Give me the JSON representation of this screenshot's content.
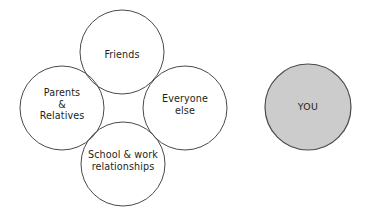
{
  "diagram": {
    "type": "venn-quatrefoil",
    "background_color": "#ffffff",
    "outline_color": "#4a4a4a",
    "text_color": "#231f20",
    "fill_color": "#cccccc",
    "groups": {
      "friends": {
        "label": "Friends",
        "shape": "circle",
        "position": "top",
        "cx": 122,
        "cy": 52,
        "r": 42,
        "filled": false
      },
      "parents": {
        "label": "Parents\n&\nRelatives",
        "shape": "circle",
        "position": "left",
        "cx": 62,
        "cy": 108,
        "r": 42,
        "filled": false
      },
      "everyone": {
        "label": "Everyone\nelse",
        "shape": "circle",
        "position": "right",
        "cx": 185,
        "cy": 108,
        "r": 42,
        "filled": false
      },
      "school": {
        "label": "School & work\nrelationships",
        "shape": "circle",
        "position": "bottom",
        "cx": 123,
        "cy": 164,
        "r": 42,
        "filled": false
      },
      "you": {
        "label": "YOU",
        "shape": "circle",
        "position": "standalone-right",
        "cx": 308,
        "cy": 107,
        "r": 43,
        "filled": true
      }
    }
  }
}
